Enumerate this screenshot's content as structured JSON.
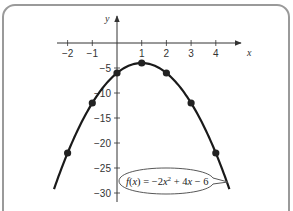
{
  "chart_data": {
    "type": "line",
    "title": "",
    "xlabel": "x",
    "ylabel": "y",
    "xlim": [
      -2.2,
      5
    ],
    "ylim": [
      -31,
      4
    ],
    "x_ticks": [
      -2,
      -1,
      1,
      2,
      3,
      4
    ],
    "x_tick_labels": [
      "−2",
      "−1",
      "1",
      "2",
      "3",
      "4"
    ],
    "y_ticks": [
      -5,
      -10,
      -15,
      -20,
      -25,
      -30
    ],
    "y_tick_labels": [
      "−5",
      "−10",
      "−15",
      "−20",
      "−25",
      "−30"
    ],
    "grid": false,
    "series": [
      {
        "name": "f(x) = −2x² + 4x − 6",
        "function": "-2x^2 + 4x - 6",
        "x": [
          -2,
          -1,
          0,
          1,
          2,
          3,
          4
        ],
        "y": [
          -22,
          -12,
          -6,
          -4,
          -6,
          -12,
          -22
        ],
        "markers": true
      }
    ],
    "annotation": {
      "text": "f(x) = −2x² + 4x − 6",
      "style": "callout-ellipse"
    }
  },
  "axis": {
    "x_name": "x",
    "y_name": "y"
  },
  "label": {
    "f": "f",
    "open": "(",
    "xvar": "x",
    "close_eq": ") = −2",
    "x2": "x",
    "sup": "2",
    "plus4": " + 4",
    "x3": "x",
    "minus6": " − 6"
  }
}
